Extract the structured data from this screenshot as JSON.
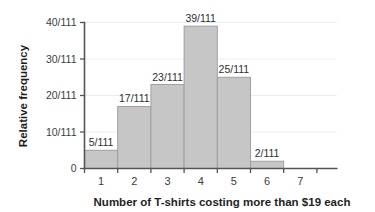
{
  "chart_data": {
    "type": "bar",
    "title": "",
    "subtitle": "",
    "xlabel": "Number of T-shirts costing more than $19 each",
    "ylabel": "Relative frequency",
    "categories": [
      "1",
      "2",
      "3",
      "4",
      "5",
      "6",
      "7"
    ],
    "values": [
      5,
      17,
      23,
      39,
      25,
      2,
      0
    ],
    "value_labels": [
      "5/111",
      "17/111",
      "23/111",
      "39/111",
      "25/111",
      "2/111",
      ""
    ],
    "denominator": 111,
    "ylim": [
      0,
      40
    ],
    "y_ticks": [
      0,
      10,
      20,
      30,
      40
    ],
    "y_tick_labels": [
      "0",
      "10/111",
      "20/111",
      "30/111",
      "40/111"
    ],
    "x_tick_labels": [
      "1",
      "2",
      "3",
      "4",
      "5",
      "6",
      "7"
    ],
    "x_bin_edges": [
      0.5,
      1.5,
      2.5,
      3.5,
      4.5,
      5.5,
      6.5,
      7.5
    ],
    "grid": false,
    "legend": "none",
    "bar_fill_color": "#c6c6c6",
    "bar_stroke_color": "#9a9a9a",
    "axis_color": "#555555",
    "text_color": "#3d3d3d",
    "background_color": "#ffffff"
  }
}
